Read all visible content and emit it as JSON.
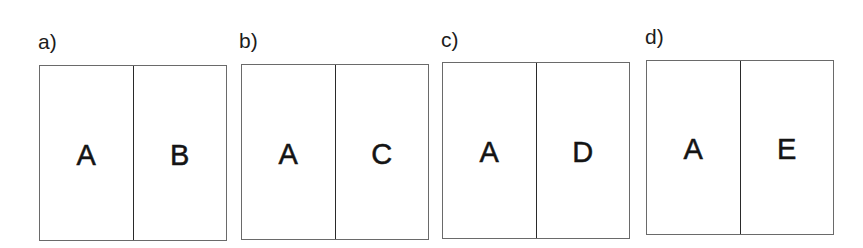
{
  "diagram": {
    "panels": [
      {
        "id": "a",
        "label": "a)",
        "cells": [
          "A",
          "B"
        ]
      },
      {
        "id": "b",
        "label": "b)",
        "cells": [
          "A",
          "C"
        ]
      },
      {
        "id": "c",
        "label": "c)",
        "cells": [
          "A",
          "D"
        ]
      },
      {
        "id": "d",
        "label": "d)",
        "cells": [
          "A",
          "E"
        ]
      }
    ]
  },
  "colors": {
    "background": "#ffffff",
    "box_border": "#6a6a6a",
    "divider": "#2a2a2a",
    "text": "#141414"
  }
}
